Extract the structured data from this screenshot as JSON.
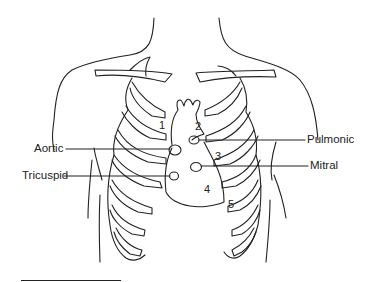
{
  "diagram": {
    "labels": {
      "aortic": "Aortic",
      "tricuspid": "Tricuspid",
      "pulmonic": "Pulmonic",
      "mitral": "Mitral"
    },
    "numbers": [
      "1",
      "2",
      "3",
      "4",
      "5"
    ],
    "line_color": "#222222",
    "background": "#ffffff"
  }
}
